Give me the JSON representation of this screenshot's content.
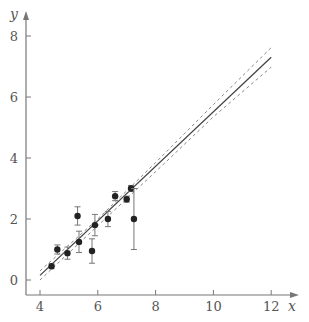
{
  "chart_data": {
    "type": "scatter",
    "title": "",
    "xlabel": "x",
    "ylabel": "y",
    "xlim": [
      3.6,
      12.8
    ],
    "ylim": [
      -0.5,
      8.7
    ],
    "xticks": [
      4,
      6,
      8,
      10,
      12
    ],
    "yticks": [
      0,
      2,
      4,
      6,
      8
    ],
    "grid": false,
    "legend": null,
    "series": [
      {
        "name": "measurements",
        "kind": "points_with_error_bars",
        "points": [
          {
            "x": 4.4,
            "y": 0.45,
            "err": 0.08
          },
          {
            "x": 4.6,
            "y": 1.0,
            "err": 0.15
          },
          {
            "x": 4.95,
            "y": 0.88,
            "err": 0.2
          },
          {
            "x": 5.3,
            "y": 2.1,
            "err": 0.3
          },
          {
            "x": 5.35,
            "y": 1.25,
            "err": 0.35
          },
          {
            "x": 5.8,
            "y": 0.95,
            "err": 0.4
          },
          {
            "x": 5.9,
            "y": 1.8,
            "err": 0.35
          },
          {
            "x": 6.35,
            "y": 2.0,
            "err": 0.25
          },
          {
            "x": 6.6,
            "y": 2.75,
            "err": 0.15
          },
          {
            "x": 7.0,
            "y": 2.65,
            "err": 0.1
          },
          {
            "x": 7.15,
            "y": 3.0,
            "err": 0.1
          },
          {
            "x": 7.25,
            "y": 2.0,
            "err": 1.0
          }
        ]
      },
      {
        "name": "fit line",
        "kind": "line",
        "style": "solid",
        "x": [
          4,
          12
        ],
        "y": [
          0.15,
          7.3
        ]
      },
      {
        "name": "upper confidence band",
        "kind": "line",
        "style": "dashed",
        "x": [
          4,
          6,
          8,
          10,
          12
        ],
        "y": [
          0.3,
          2.0,
          3.85,
          5.75,
          7.62
        ]
      },
      {
        "name": "lower confidence band",
        "kind": "line",
        "style": "dashed",
        "x": [
          4,
          6,
          8,
          10,
          12
        ],
        "y": [
          0.0,
          1.78,
          3.55,
          5.35,
          6.98
        ]
      }
    ]
  },
  "axes": {
    "x_label": "x",
    "y_label": "y",
    "x_tick_labels": [
      "4",
      "6",
      "8",
      "10",
      "12"
    ],
    "y_tick_labels": [
      "0",
      "2",
      "4",
      "6",
      "8"
    ]
  },
  "colors": {
    "axis": "#777777",
    "points": "#222222",
    "error_bars": "#777777",
    "fit_line": "#444444",
    "bands": "#888888"
  }
}
